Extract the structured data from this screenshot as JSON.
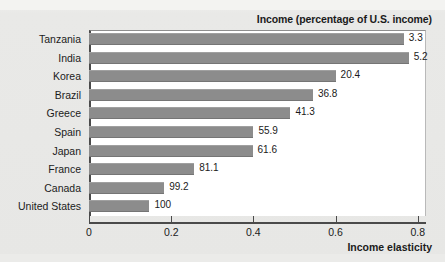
{
  "chart_data": {
    "type": "bar",
    "orientation": "horizontal",
    "title": "Income (percentage of U.S. income)",
    "xlabel": "Income elasticity",
    "ylabel": "",
    "xlim": [
      0,
      0.82
    ],
    "xticks": [
      "0",
      "0.2",
      "0.4",
      "0.6",
      "0.8"
    ],
    "xtick_values": [
      0,
      0.2,
      0.4,
      0.6,
      0.8
    ],
    "grid": false,
    "legend": false,
    "bar_color": "#8c8c8c",
    "plot_background": "#ffffff",
    "page_background": "#e9e9e7",
    "categories": [
      "Tanzania",
      "India",
      "Korea",
      "Brazil",
      "Greece",
      "Spain",
      "Japan",
      "France",
      "Canada",
      "United States"
    ],
    "values": [
      0.766,
      0.778,
      0.6,
      0.545,
      0.49,
      0.4,
      0.398,
      0.256,
      0.183,
      0.147
    ],
    "data_labels": [
      "3.3",
      "5.2",
      "20.4",
      "36.8",
      "41.3",
      "55.9",
      "61.6",
      "81.1",
      "99.2",
      "100"
    ],
    "series": [
      {
        "name": "Income elasticity",
        "values": [
          0.766,
          0.778,
          0.6,
          0.545,
          0.49,
          0.4,
          0.398,
          0.256,
          0.183,
          0.147
        ]
      }
    ],
    "annotations": [
      {
        "category": "Tanzania",
        "label": "3.3",
        "meaning": "income as percentage of U.S. income"
      },
      {
        "category": "India",
        "label": "5.2",
        "meaning": "income as percentage of U.S. income"
      },
      {
        "category": "Korea",
        "label": "20.4",
        "meaning": "income as percentage of U.S. income"
      },
      {
        "category": "Brazil",
        "label": "36.8",
        "meaning": "income as percentage of U.S. income"
      },
      {
        "category": "Greece",
        "label": "41.3",
        "meaning": "income as percentage of U.S. income"
      },
      {
        "category": "Spain",
        "label": "55.9",
        "meaning": "income as percentage of U.S. income"
      },
      {
        "category": "Japan",
        "label": "61.6",
        "meaning": "income as percentage of U.S. income"
      },
      {
        "category": "France",
        "label": "81.1",
        "meaning": "income as percentage of U.S. income"
      },
      {
        "category": "Canada",
        "label": "99.2",
        "meaning": "income as percentage of U.S. income"
      },
      {
        "category": "United States",
        "label": "100",
        "meaning": "income as percentage of U.S. income"
      }
    ]
  }
}
